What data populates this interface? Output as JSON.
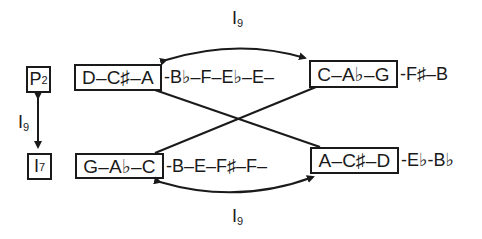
{
  "diagram": {
    "row_labels": {
      "top": {
        "letter": "P",
        "sub": "2"
      },
      "bottom": {
        "letter": "I",
        "sub": "7"
      }
    },
    "vertical_relation": {
      "letter": "I",
      "sub": "9"
    },
    "top_arc_relation": {
      "letter": "I",
      "sub": "9"
    },
    "bottom_arc_relation": {
      "letter": "I",
      "sub": "9"
    },
    "top_row": {
      "box_left": "D–C♯–A",
      "middle": "-B♭–F–E♭–E–",
      "box_right": "C–A♭–G",
      "tail": "-F♯–B"
    },
    "bottom_row": {
      "box_left": "G–A♭–C",
      "middle": "-B–E–F♯–F–",
      "box_right": "A–C♯–D",
      "tail": "-E♭-B♭"
    }
  }
}
